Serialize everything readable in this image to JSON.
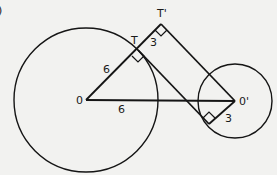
{
  "diagram": {
    "corner_mark": ")",
    "points": {
      "O": {
        "label": "0"
      },
      "O_prime": {
        "label": "0'"
      },
      "T": {
        "label": "T"
      },
      "T_prime": {
        "label": "T'"
      }
    },
    "segment_labels": {
      "OT": "6",
      "OO_prime": "6",
      "TT_prime": "3",
      "O_prime_foot": "3"
    },
    "circles": [
      {
        "name": "large-circle",
        "center": "O"
      },
      {
        "name": "small-circle",
        "center": "O'"
      }
    ],
    "colors": {
      "background": "#f2f2f0",
      "ink": "#151515"
    }
  }
}
